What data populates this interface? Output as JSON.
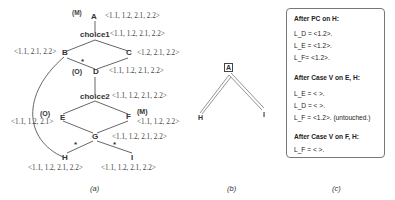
{
  "figure_a": {
    "caption": "(a)",
    "nodes": {
      "A": {
        "name": "A",
        "tag": "(M)",
        "label": "<1.1, 1.2, 2.1, 2.2>"
      },
      "choice1": {
        "name": "choice1",
        "label": "<1.1, 1.2, 2.1, 2.2>"
      },
      "B": {
        "name": "B",
        "label": "<1.1, 2.1, 2.2>"
      },
      "C": {
        "name": "C",
        "label": "<1.2, 2.1, 2.2>"
      },
      "D": {
        "name": "D",
        "tag": "(O)",
        "label": "<1.1, 1.2, 2.1, 2.2>"
      },
      "choice2": {
        "name": "choice2",
        "label": "<1.1, 1.2, 2.1, 2.2>"
      },
      "E": {
        "name": "E",
        "tag": "(O)",
        "label": "<1.1, 1.2, 2.1>"
      },
      "F": {
        "name": "F",
        "tag": "(M)",
        "label": "<1.1, 1.2, 2.2>"
      },
      "G": {
        "name": "G",
        "label": "<1.1, 1.2, 2.1, 2.2>"
      },
      "H": {
        "name": "H",
        "label": "<1.1, 1.2, 2.1, 2.2>"
      },
      "I": {
        "name": "I",
        "label": "<1.1, 1.2, 2.1, 2.2>"
      }
    },
    "star": "*"
  },
  "figure_b": {
    "caption": "(b)",
    "nodes": {
      "A": "A",
      "H": "H",
      "I": "I"
    }
  },
  "figure_c": {
    "caption": "(c)",
    "sections": [
      {
        "heading": "After PC on H:",
        "lines": [
          "L_D = <1.2>.",
          "L_E = <1.2>.",
          "L_F= <1.2>."
        ]
      },
      {
        "heading": "After Case V on E, H:",
        "lines": [
          "L_E = < >.",
          "L_D = < >.",
          "L_F = <1.2>. (untouched.)"
        ]
      },
      {
        "heading": "After Case V on F, H:",
        "lines": [
          "L_F = < >."
        ]
      }
    ]
  }
}
